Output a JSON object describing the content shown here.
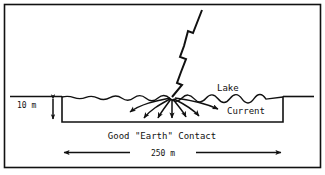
{
  "figure": {
    "background_color": "#ffffff",
    "ink_color": "#111111",
    "border": {
      "name": "figure-border",
      "visible": true
    }
  },
  "labels": {
    "lake": "Lake",
    "current": "Current",
    "depth": "10 m",
    "earth_contact": "Good \"Earth\" Contact",
    "width": "250 m"
  },
  "annotations": {
    "depth_dimension": {
      "value": "10 m",
      "orientation": "vertical",
      "double_headed": true
    },
    "width_dimension": {
      "value": "250 m",
      "orientation": "horizontal",
      "double_headed": true
    }
  },
  "elements": {
    "lightning_bolt": "lightning-bolt",
    "water_surface": "water-surface-line",
    "ground_line_left": "ground-line-left",
    "ground_line_right": "ground-line-right",
    "lake_basin": "lake-basin-outline",
    "current_arrows_count": 7
  }
}
